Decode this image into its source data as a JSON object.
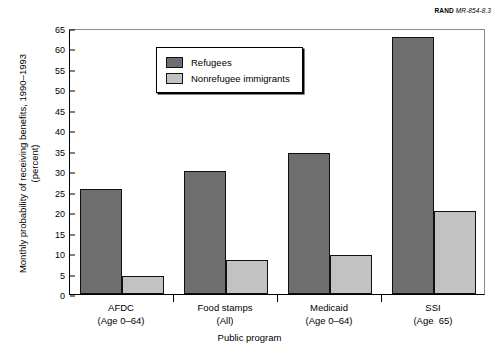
{
  "source_credit": {
    "brand": "RAND",
    "id": "MR-854-8.3"
  },
  "chart_data": {
    "type": "bar",
    "title": "",
    "xlabel": "Public program",
    "ylabel": "Monthly probability of receiving benefits, 1990–1993\n(percent)",
    "ylim": [
      0,
      65
    ],
    "ytick_step": 5,
    "yticks": [
      "0",
      "5",
      "10",
      "15",
      "20",
      "25",
      "30",
      "35",
      "40",
      "45",
      "50",
      "55",
      "60",
      "65"
    ],
    "grid": false,
    "legend_position": "upper-center-left",
    "categories": [
      "AFDC",
      "Food stamps",
      "Medicaid",
      "SSI"
    ],
    "category_sublabels": [
      "(Age 0–64)",
      "(All)",
      "(Age 0–64)",
      "(Age  65)"
    ],
    "series": [
      {
        "name": "Refugees",
        "color": "#6e6e6e",
        "values": [
          25.7,
          30.1,
          34.4,
          62.7
        ]
      },
      {
        "name": "Nonrefugee immigrants",
        "color": "#c2c2c2",
        "values": [
          4.5,
          8.2,
          9.5,
          20.3
        ]
      }
    ]
  }
}
